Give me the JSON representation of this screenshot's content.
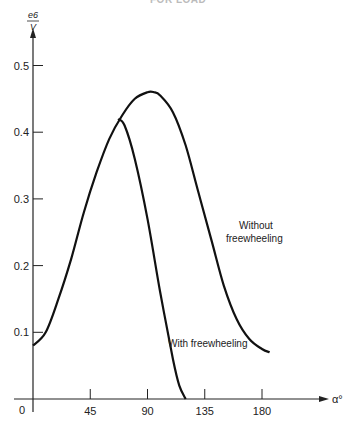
{
  "header": {
    "partial_text": "FOR LOAD"
  },
  "chart_data": {
    "type": "line",
    "title": "",
    "xlabel": "α°",
    "ylabel": "e6 / V",
    "ylabel_numerator": "e6",
    "ylabel_denominator": "V",
    "xlim": [
      0,
      190
    ],
    "ylim": [
      0,
      0.55
    ],
    "grid": false,
    "legend": "inline labels",
    "x_ticks": [
      0,
      45,
      90,
      135,
      180
    ],
    "y_ticks": [
      0.1,
      0.2,
      0.3,
      0.4,
      0.5
    ],
    "x_tick_labels": [
      "0",
      "45",
      "90",
      "135",
      "180"
    ],
    "y_tick_labels": [
      "0.1",
      "0.2",
      "0.3",
      "0.4",
      "0.5"
    ],
    "series": [
      {
        "name": "Without freewheeling",
        "label_lines": [
          "Without",
          "freewheeling"
        ],
        "x": [
          0,
          10,
          20,
          30,
          40,
          50,
          60,
          70,
          80,
          90,
          95,
          100,
          110,
          120,
          130,
          140,
          150,
          160,
          170,
          180,
          186
        ],
        "y": [
          0.08,
          0.1,
          0.15,
          0.21,
          0.28,
          0.34,
          0.39,
          0.425,
          0.45,
          0.46,
          0.46,
          0.455,
          0.43,
          0.38,
          0.31,
          0.24,
          0.17,
          0.12,
          0.09,
          0.075,
          0.07
        ]
      },
      {
        "name": "With freewheeling",
        "label_lines": [
          "With freewheeling"
        ],
        "x": [
          67,
          72,
          80,
          90,
          100,
          110,
          115,
          120
        ],
        "y": [
          0.42,
          0.41,
          0.36,
          0.27,
          0.16,
          0.06,
          0.02,
          0.0
        ]
      }
    ]
  }
}
